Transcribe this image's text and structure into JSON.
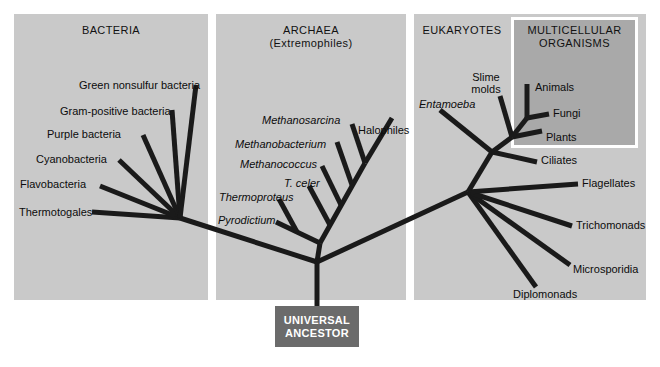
{
  "figure": {
    "type": "phylogenetic-tree",
    "root_label": "UNIVERSAL\nANCESTOR",
    "root_line1": "UNIVERSAL",
    "root_line2": "ANCESTOR",
    "colors": {
      "background": "#ffffff",
      "panel_gray": "#c9c9c9",
      "dark_panel_gray": "#a9a9a9",
      "branch_black": "#1a1a1a",
      "ancestor_box": "#6b6b6b",
      "ancestor_text": "#ffffff",
      "box_border": "#ffffff"
    }
  },
  "panels": [
    {
      "id": "bacteria",
      "title": "BACTERIA",
      "title_line2": ""
    },
    {
      "id": "archaea",
      "title": "ARCHAEA",
      "title_line2": "(Extremophiles)"
    },
    {
      "id": "eukaryotes",
      "title": "EUKARYOTES",
      "title_line2": ""
    },
    {
      "id": "multicellular",
      "title": "MULTICELLULAR",
      "title_line2": "ORGANISMS"
    }
  ],
  "taxa": {
    "bacteria": [
      {
        "name": "Green nonsulfur bacteria",
        "italic": false
      },
      {
        "name": "Gram-positive bacteria",
        "italic": false
      },
      {
        "name": "Purple bacteria",
        "italic": false
      },
      {
        "name": "Cyanobacteria",
        "italic": false
      },
      {
        "name": "Flavobacteria",
        "italic": false
      },
      {
        "name": "Thermotogales",
        "italic": false
      }
    ],
    "archaea": [
      {
        "name": "Methanosarcina",
        "italic": true
      },
      {
        "name": "Halophiles",
        "italic": false
      },
      {
        "name": "Methanobacterium",
        "italic": true
      },
      {
        "name": "Methanococcus",
        "italic": true
      },
      {
        "name": "T. celer",
        "italic": true
      },
      {
        "name": "Thermoproteus",
        "italic": true
      },
      {
        "name": "Pyrodictium",
        "italic": true
      }
    ],
    "eukaryotes": [
      {
        "name": "Entamoeba",
        "italic": true
      },
      {
        "name": "Slime molds",
        "italic": false,
        "line1": "Slime",
        "line2": "molds"
      },
      {
        "name": "Animals",
        "italic": false
      },
      {
        "name": "Fungi",
        "italic": false
      },
      {
        "name": "Plants",
        "italic": false
      },
      {
        "name": "Ciliates",
        "italic": false
      },
      {
        "name": "Flagellates",
        "italic": false
      },
      {
        "name": "Trichomonads",
        "italic": false
      },
      {
        "name": "Microsporidia",
        "italic": false
      },
      {
        "name": "Diplomonads",
        "italic": false
      }
    ]
  }
}
